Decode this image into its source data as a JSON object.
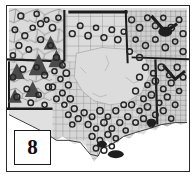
{
  "figure": {
    "number_label": "8",
    "kind": "grayscale-thematic-map",
    "caption_visible": false
  },
  "frame": {
    "border_color": "#2b2b2b",
    "background_color": "#ffffff"
  },
  "legend_box": {
    "label": "8",
    "border_color": "#1a1a1a",
    "background_color": "#ffffff"
  },
  "palette": {
    "page_background": "#ffffff",
    "land_light": "#e6e6e6",
    "land_mid": "#d2d2d2",
    "land_dark": "#b9b9b9",
    "central_region": "#d9d9d9",
    "grid_line": "#8a8a8a",
    "boundary_heavy": "#1b1b1b",
    "marker_circle": "#262626",
    "marker_triangle": "#4a4a4a",
    "coastline": "#3a3a3a"
  },
  "map_content": {
    "description": "Grayscale map of a south-central region with county-level grid lines, heavy state boundary lines, a large light-gray unfilled central region, dense clusters of open circle symbols, and several solid triangle symbols in the western portion.",
    "symbols": [
      {
        "name": "circle-marker",
        "shape": "open circle",
        "fill": "#262626",
        "count_approx": 180
      },
      {
        "name": "triangle-marker",
        "shape": "solid triangle",
        "fill": "#4a4a4a",
        "count_approx": 6
      }
    ],
    "regions": [
      {
        "name": "northwest-panel",
        "tone": "#dedede"
      },
      {
        "name": "north-band",
        "tone": "#d2d2d2"
      },
      {
        "name": "central-plain",
        "tone": "#d9d9d9"
      },
      {
        "name": "east-hatched",
        "tone": "#cacaca"
      },
      {
        "name": "southeast-coast",
        "tone": "#e2e2e2"
      }
    ]
  }
}
